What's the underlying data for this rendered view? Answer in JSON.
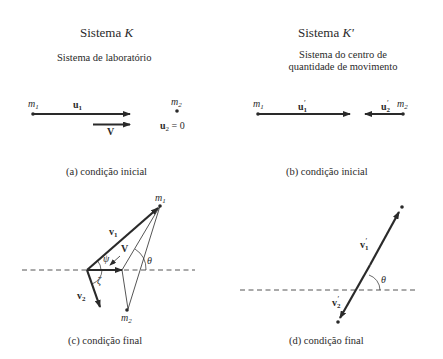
{
  "panels": {
    "left": {
      "title": "Sistema K",
      "title_prefix": "Sistema ",
      "title_symbol": "K",
      "subtitle": "Sistema de laboratório"
    },
    "right": {
      "title": "Sistema K'",
      "title_prefix": "Sistema ",
      "title_symbol": "K'",
      "subtitle_line1": "Sistema do centro de",
      "subtitle_line2": "quantidade de movimento"
    }
  },
  "diagram_a": {
    "caption": "(a) condição inicial",
    "labels": {
      "m1": "m",
      "m1_sub": "1",
      "u1": "u",
      "u1_sub": "1",
      "V": "V",
      "m2": "m",
      "m2_sub": "2",
      "u2": "u",
      "u2_sub": "2",
      "u2_eq": " = 0"
    }
  },
  "diagram_b": {
    "caption": "(b) condição inicial",
    "labels": {
      "m1": "m",
      "m1_sub": "1",
      "u1p": "u",
      "u1p_sub": "1",
      "u1p_prime": "′",
      "u2p": "u",
      "u2p_sub": "2",
      "u2p_prime": "′",
      "m2": "m",
      "m2_sub": "2"
    }
  },
  "diagram_c": {
    "caption": "(c) condição final",
    "labels": {
      "m1": "m",
      "m1_sub": "1",
      "v1": "v",
      "v1_sub": "1",
      "V": "V",
      "psi": "ψ",
      "theta": "θ",
      "zeta": "ζ",
      "v2": "v",
      "v2_sub": "2",
      "m2": "m",
      "m2_sub": "2"
    }
  },
  "diagram_d": {
    "caption": "(d) condição final",
    "labels": {
      "v1p": "v",
      "v1p_sub": "1",
      "v1p_prime": "′",
      "theta": "θ",
      "v2p": "v",
      "v2p_sub": "2",
      "v2p_prime": "′"
    }
  },
  "colors": {
    "ink": "#2a2a2a",
    "background": "#ffffff"
  }
}
